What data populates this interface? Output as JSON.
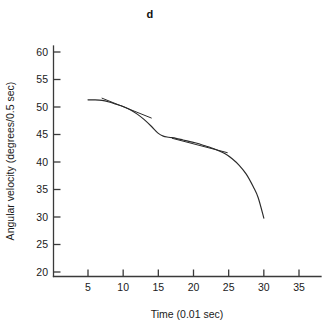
{
  "chart_data": {
    "type": "line",
    "title": "d",
    "xlabel": "Time (0.01 sec)",
    "ylabel": "Angular velocity (degrees/0.5 sec)",
    "xlim": [
      0,
      37.5
    ],
    "ylim": [
      20,
      61.5
    ],
    "xticks": [
      5,
      10,
      15,
      20,
      25,
      30,
      35
    ],
    "xticklabels": [
      "5",
      "10",
      "15",
      "20",
      "25",
      "30",
      "35"
    ],
    "yticks": [
      20,
      25,
      30,
      35,
      40,
      45,
      50,
      55,
      60
    ],
    "yticklabels": [
      "20",
      "25",
      "30",
      "35",
      "40",
      "45",
      "50",
      "55",
      "60"
    ],
    "grid": false,
    "legend": null,
    "series": [
      {
        "name": "angular-velocity-curve",
        "x": [
          5.0,
          6.0,
          7.0,
          8.0,
          9.0,
          10.0,
          11.0,
          12.0,
          13.0,
          14.0,
          15.0,
          15.7,
          16.5,
          17.5,
          18.5,
          19.5,
          20.5,
          21.5,
          22.5,
          23.5,
          24.5,
          25.5,
          26.5,
          27.5,
          28.5,
          29.2,
          30.0
        ],
        "y": [
          51.3,
          51.3,
          51.2,
          50.9,
          50.5,
          50.1,
          49.5,
          48.7,
          47.7,
          46.5,
          45.2,
          44.7,
          44.5,
          44.3,
          44.0,
          43.7,
          43.4,
          43.0,
          42.6,
          42.1,
          41.5,
          40.6,
          39.4,
          37.8,
          35.5,
          33.5,
          29.8
        ]
      },
      {
        "name": "tangent-line-1",
        "x": [
          7.0,
          14.0
        ],
        "y": [
          51.6,
          48.0
        ]
      },
      {
        "name": "tangent-line-2",
        "x": [
          17.0,
          24.8
        ],
        "y": [
          44.3,
          41.7
        ]
      }
    ],
    "annotations": []
  },
  "colors": {
    "background": "#ffffff",
    "axis": "#3a3a3a",
    "curve": "#2a2a2a",
    "text": "#1a1a1a"
  }
}
